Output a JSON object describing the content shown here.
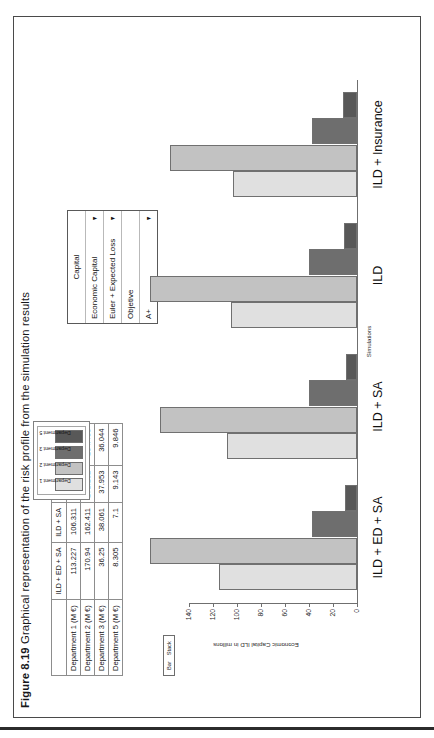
{
  "caption": {
    "number": "Figure 8.19",
    "text": "Graphical representation of the risk profile from the simulation results"
  },
  "table": {
    "columns": [
      "",
      "ILD + ED + SA",
      "ILD + SA",
      "ILD",
      "ILD + INS"
    ],
    "rows": [
      {
        "label": "Department 1 (M €)",
        "values": [
          "113.227",
          "106.311",
          "103.169",
          "101.326"
        ]
      },
      {
        "label": "Department 2 (M €)",
        "values": [
          "170.94",
          "162.411",
          "171.152",
          "154.435"
        ]
      },
      {
        "label": "Department 3 (M €)",
        "values": [
          "36.25",
          "38.061",
          "37.953",
          "36.044"
        ]
      },
      {
        "label": "Department 5 (M €)",
        "values": [
          "8.305",
          "7.1",
          "9.143",
          "9.846"
        ]
      }
    ]
  },
  "panel": {
    "title": "Capital",
    "rows": [
      {
        "label": "Economic Capital",
        "icon": "chevron-down-icon"
      },
      {
        "label": "Euler + Expected Loss",
        "icon": "chevron-down-icon"
      },
      {
        "label": "Objetive",
        "icon": ""
      },
      {
        "label": "A+",
        "icon": "chevron-down-icon"
      }
    ]
  },
  "toolbar": {
    "items": [
      "Bar",
      "Stack"
    ]
  },
  "legend": {
    "position": "top-center",
    "entries": [
      {
        "label": "Department 1",
        "color": "#e0e0e0"
      },
      {
        "label": "Department 2",
        "color": "#c2c2c2"
      },
      {
        "label": "Department 3",
        "color": "#6e6e6e"
      },
      {
        "label": "Department 5",
        "color": "#585858"
      }
    ]
  },
  "chart_data": {
    "type": "bar",
    "title": "",
    "xlabel": "Simulations",
    "ylabel": "Economic Capital ILD in millons",
    "categories": [
      "ILD + ED + SA",
      "ILD + SA",
      "ILD",
      "ILD + Insurance"
    ],
    "ytick_labels": [
      "0",
      "20",
      "40",
      "60",
      "80",
      "100",
      "120",
      "140"
    ],
    "ylim": [
      0,
      140
    ],
    "grid": false,
    "series": [
      {
        "name": "Department 1",
        "color": "#e0e0e0",
        "values": [
          113.227,
          106.311,
          103.169,
          101.326
        ]
      },
      {
        "name": "Department 2",
        "color": "#c2c2c2",
        "values": [
          170.94,
          162.411,
          171.152,
          154.435
        ]
      },
      {
        "name": "Department 3",
        "color": "#6e6e6e",
        "values": [
          36.25,
          38.061,
          37.953,
          36.044
        ]
      },
      {
        "name": "Department 5",
        "color": "#585858",
        "values": [
          8.305,
          7.1,
          9.143,
          9.846
        ]
      }
    ]
  }
}
